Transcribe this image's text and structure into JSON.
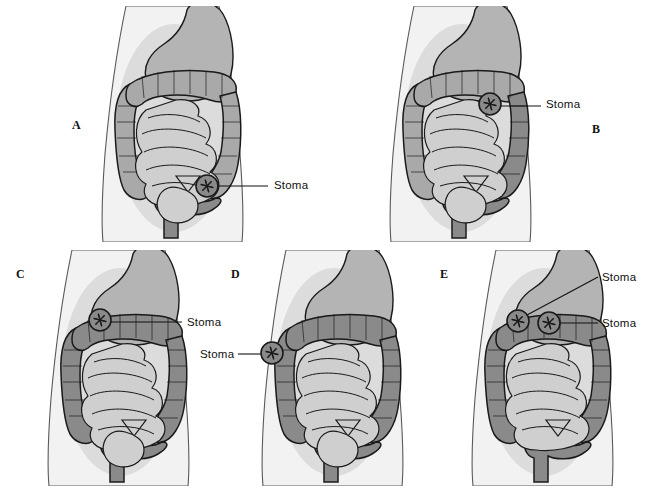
{
  "figure": {
    "background_color": "#ffffff",
    "panel_count": 5
  },
  "palette": {
    "body_fill": "#f2f2f2",
    "body_outline": "#5a5a5a",
    "viscera_shadow": "#d6d6d6",
    "stomach_fill": "#b4b4b4",
    "colon_light": "#a9a9a9",
    "colon_dark": "#8a8a8a",
    "small_bowel_fill": "#cfcfcf",
    "outline": "#1a1a1a",
    "label_color": "#111111",
    "leader_line_color": "#111111"
  },
  "panels": [
    {
      "id": "A",
      "letter": "A",
      "letter_x": 72,
      "letter_y": 118,
      "description": "Sigmoid colostomy - stoma in lower left abdomen",
      "stomas": [
        {
          "name": "stoma-marker",
          "label": "Stoma",
          "cx": 207,
          "cy": 186,
          "r": 11,
          "label_x": 274,
          "label_y": 179,
          "leader": {
            "x1": 218,
            "y1": 186,
            "x2": 268,
            "y2": 186
          }
        }
      ]
    },
    {
      "id": "B",
      "letter": "B",
      "letter_x": 592,
      "letter_y": 122,
      "description": "Descending colostomy - stoma in left mid abdomen",
      "stomas": [
        {
          "name": "stoma-marker",
          "label": "Stoma",
          "cx": 490,
          "cy": 104,
          "r": 11,
          "label_x": 546,
          "label_y": 98,
          "leader": {
            "x1": 501,
            "y1": 106,
            "x2": 541,
            "y2": 106
          }
        }
      ]
    },
    {
      "id": "C",
      "letter": "C",
      "letter_x": 16,
      "letter_y": 267,
      "description": "Transverse colostomy - single stoma upper abdomen",
      "stomas": [
        {
          "name": "stoma-marker",
          "label": "Stoma",
          "cx": 100,
          "cy": 320,
          "r": 11,
          "label_x": 187,
          "label_y": 316,
          "leader": {
            "x1": 111,
            "y1": 322,
            "x2": 182,
            "y2": 322
          }
        }
      ]
    },
    {
      "id": "D",
      "letter": "D",
      "letter_x": 231,
      "letter_y": 267,
      "description": "Ascending colostomy - stoma right abdomen",
      "stomas": [
        {
          "name": "stoma-marker",
          "label": "Stoma",
          "cx": 272,
          "cy": 353,
          "r": 11,
          "label_x": 200,
          "label_y": 348,
          "leader": {
            "x1": 261,
            "y1": 354,
            "x2": 238,
            "y2": 354
          }
        }
      ]
    },
    {
      "id": "E",
      "letter": "E",
      "letter_x": 440,
      "letter_y": 267,
      "description": "Double-barrel transverse colostomy - two adjacent stomas",
      "stomas": [
        {
          "name": "stoma-marker-proximal",
          "label": "Stoma",
          "cx": 518,
          "cy": 321,
          "r": 11,
          "label_x": 602,
          "label_y": 271,
          "leader": {
            "x1": 527,
            "y1": 315,
            "x2": 598,
            "y2": 277
          }
        },
        {
          "name": "stoma-marker-distal",
          "label": "Stoma",
          "cx": 549,
          "cy": 323,
          "r": 11,
          "label_x": 602,
          "label_y": 317,
          "leader": {
            "x1": 560,
            "y1": 323,
            "x2": 598,
            "y2": 323
          }
        }
      ]
    }
  ]
}
